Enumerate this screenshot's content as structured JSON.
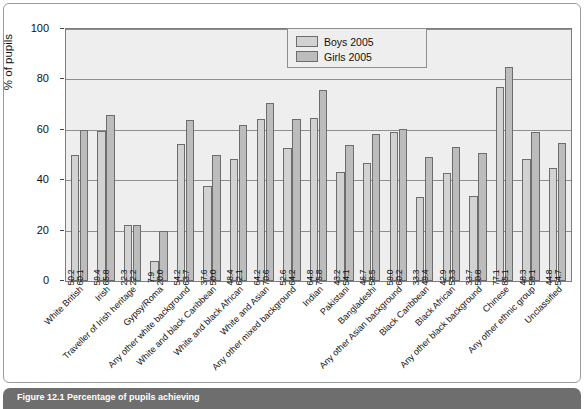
{
  "chart_data": {
    "type": "bar",
    "title": "",
    "xlabel": "",
    "ylabel": "% of pupils",
    "ylim": [
      0,
      100
    ],
    "yticks": [
      0,
      20,
      40,
      60,
      80,
      100
    ],
    "grid": true,
    "legend_position": "top-center",
    "categories": [
      "White British",
      "Irish",
      "Traveller of Irish heritage",
      "Gypsy/Roma",
      "Any other white background",
      "White and black Caribbean",
      "White and black African",
      "White and Asian",
      "Any other mixed background",
      "Indian",
      "Pakistani",
      "Bangladeshi",
      "Any other Asian background",
      "Black Caribbean",
      "Black African",
      "Any other black background",
      "Chinese",
      "Any other ethnic group",
      "Unclassified"
    ],
    "series": [
      {
        "name": "Boys 2005",
        "color": "#d2d2d2",
        "values": [
          50.2,
          59.4,
          22.3,
          7.9,
          54.2,
          37.6,
          48.4,
          64.2,
          52.6,
          64.8,
          43.2,
          46.7,
          59.0,
          33.3,
          42.9,
          33.7,
          77.1,
          48.3,
          44.8
        ]
      },
      {
        "name": "Girls 2005",
        "color": "#bcbcbc",
        "values": [
          60.1,
          65.8,
          22.2,
          20.0,
          63.7,
          50.0,
          62.1,
          70.6,
          64.2,
          75.8,
          54.1,
          58.5,
          60.2,
          49.4,
          53.3,
          50.8,
          85.1,
          59.1,
          54.7
        ]
      }
    ]
  },
  "legend": {
    "items": [
      {
        "label": "Boys 2005"
      },
      {
        "label": "Girls 2005"
      }
    ]
  },
  "caption": {
    "text": "Figure 12.1 Percentage of pupils achieving"
  }
}
